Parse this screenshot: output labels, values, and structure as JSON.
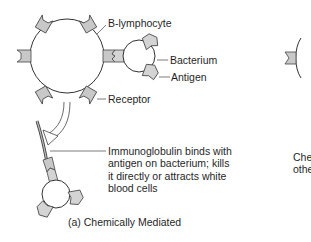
{
  "figure": {
    "panel_a": {
      "labels": {
        "b_lymphocyte": "B-lymphocyte",
        "bacterium": "Bacterium",
        "antigen": "Antigen",
        "receptor": "Receptor"
      },
      "description_lines": [
        "Immunoglobulin binds with",
        "antigen on bacterium; kills",
        "it directly or attracts white",
        "blood cells"
      ],
      "caption": "(a) Chemically Mediated"
    },
    "panel_b_partial": {
      "text_lines": [
        "Che",
        "othe"
      ]
    },
    "colors": {
      "line": "#333333",
      "receptor_fill": "#c8c8c8",
      "antigen_fill": "#d4d4d4",
      "background": "#ffffff"
    }
  }
}
